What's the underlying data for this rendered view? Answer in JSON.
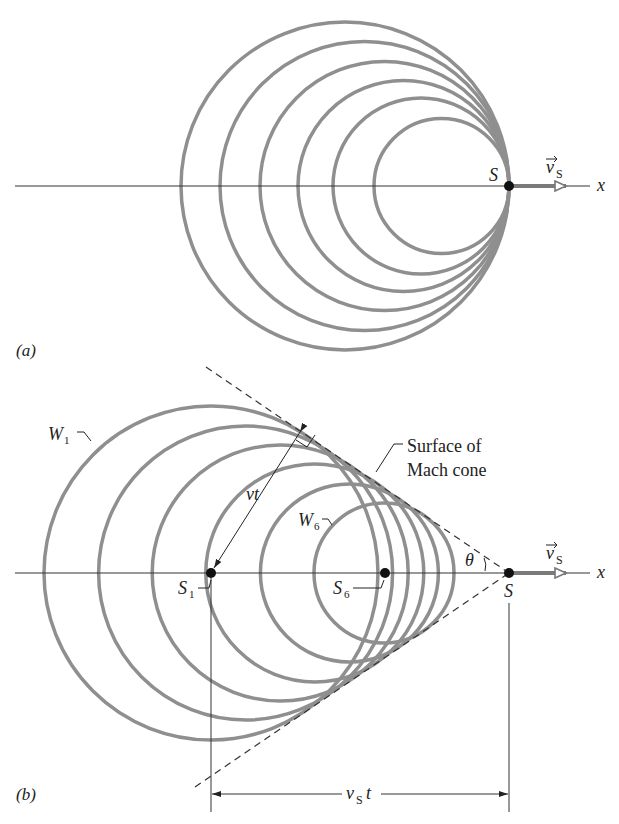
{
  "panel_a": {
    "label": "(a)",
    "source_label": "S",
    "velocity_label": "v",
    "velocity_sub": "S",
    "axis_label": "x",
    "wavefronts": [
      {
        "cx": 345,
        "r": 164
      },
      {
        "cx": 364.5,
        "r": 144.5
      },
      {
        "cx": 384.5,
        "r": 124.5
      },
      {
        "cx": 403.5,
        "r": 105.5
      },
      {
        "cx": 421,
        "r": 88
      },
      {
        "cx": 441.5,
        "r": 67.5
      }
    ]
  },
  "panel_b": {
    "label": "(b)",
    "source_label": "S",
    "s1_label": "S",
    "s1_sub": "1",
    "s6_label": "S",
    "s6_sub": "6",
    "w1_label": "W",
    "w1_sub": "1",
    "w6_label": "W",
    "w6_sub": "6",
    "vt_label": "vt",
    "theta_label": "θ",
    "cone_label_line1": "Surface of",
    "cone_label_line2": "Mach cone",
    "velocity_label": "v",
    "velocity_sub": "S",
    "axis_label": "x",
    "dimension_label": "v",
    "dimension_sub": "S",
    "dimension_t": "t",
    "wavefronts": [
      {
        "cx": 211,
        "r": 167
      },
      {
        "cx": 245.6,
        "r": 147
      },
      {
        "cx": 280.2,
        "r": 128
      },
      {
        "cx": 314.8,
        "r": 109
      },
      {
        "cx": 349.4,
        "r": 89
      },
      {
        "cx": 384,
        "r": 70
      }
    ]
  },
  "colors": {
    "wavefront": "#8f8f8f",
    "axis": "#333333",
    "dot": "#111111"
  }
}
